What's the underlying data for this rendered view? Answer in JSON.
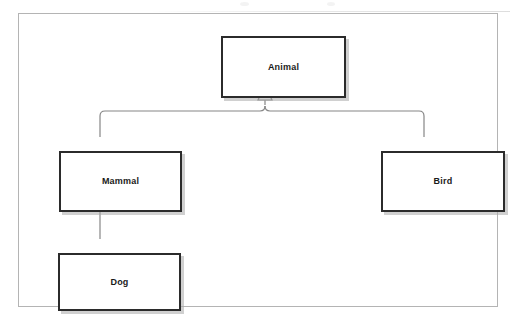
{
  "diagram": {
    "type": "uml-class-hierarchy",
    "frame": {
      "border_color": "#b4b4b4",
      "background": "#ffffff"
    },
    "style": {
      "box_border_color": "#2b2b2b",
      "box_fill_color": "#ffffff",
      "box_shadow_color": "#aaaaaa",
      "connector_color": "#868686",
      "arrowhead_fill": "#ffffff",
      "label_color": "#1a1a1a"
    },
    "nodes": [
      {
        "id": "animal",
        "label": "Animal",
        "x": 202,
        "y": 22,
        "width": 125,
        "height": 62
      },
      {
        "id": "mammal",
        "label": "Mammal",
        "x": 40,
        "y": 137,
        "width": 123,
        "height": 61
      },
      {
        "id": "bird",
        "label": "Bird",
        "x": 362,
        "y": 137,
        "width": 124,
        "height": 61
      },
      {
        "id": "dog",
        "label": "Dog",
        "x": 39,
        "y": 239,
        "width": 123,
        "height": 58
      }
    ],
    "edges": [
      {
        "id": "mammal-to-animal",
        "from": "mammal",
        "to": "animal",
        "relation": "generalization",
        "arrowhead": "hollow-triangle"
      },
      {
        "id": "bird-to-animal",
        "from": "bird",
        "to": "animal",
        "relation": "generalization",
        "arrowhead": "hollow-triangle"
      },
      {
        "id": "dog-to-mammal",
        "from": "dog",
        "to": "mammal",
        "relation": "generalization",
        "arrowhead": "hollow-triangle"
      }
    ]
  }
}
